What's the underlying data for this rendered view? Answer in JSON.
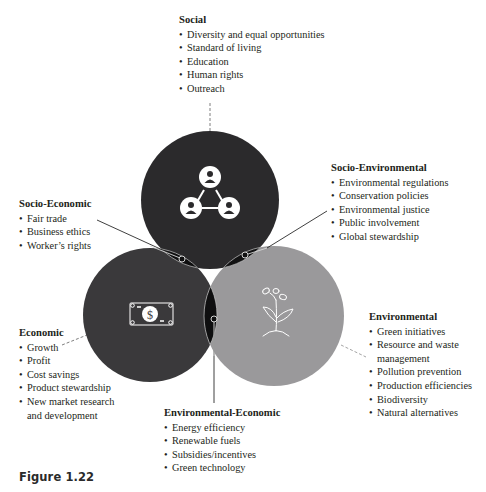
{
  "colors": {
    "social_fill": "#2b2a2c",
    "economic_fill": "#3a393b",
    "environmental_fill": "#9a999b",
    "overlap_fill": "#0f0f10",
    "outline": "#c9c9c9",
    "text": "#231f20",
    "leader": "#6f6f6f"
  },
  "social": {
    "title": "Social",
    "items": [
      "Diversity and equal opportunities",
      "Standard of living",
      "Education",
      "Human rights",
      "Outreach"
    ],
    "icon": "people-network-icon"
  },
  "socio_economic": {
    "title": "Socio-Economic",
    "items": [
      "Fair trade",
      "Business ethics",
      "Worker’s rights"
    ]
  },
  "socio_environmental": {
    "title": "Socio-Environmental",
    "items": [
      "Environmental regulations",
      "Conservation policies",
      "Environmental justice",
      "Public involvement",
      "Global stewardship"
    ]
  },
  "economic": {
    "title": "Economic",
    "items": [
      "Growth",
      "Profit",
      "Cost savings",
      "Product stewardship",
      "New market research",
      "and development"
    ],
    "icon": "dollar-bill-icon"
  },
  "environmental": {
    "title": "Environmental",
    "items": [
      "Green initiatives",
      "Resource and waste",
      "management",
      "Pollution prevention",
      "Production efficiencies",
      "Biodiversity",
      "Natural alternatives"
    ],
    "icon": "sprout-plant-icon"
  },
  "environmental_economic": {
    "title": "Environmental-Economic",
    "items": [
      "Energy efficiency",
      "Renewable fuels",
      "Subsidies/incentives",
      "Green technology"
    ]
  },
  "caption": "Figure 1.22"
}
